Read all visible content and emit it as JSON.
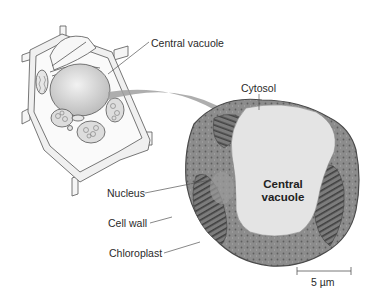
{
  "diagram": {
    "title": "",
    "labels": {
      "central_vacuole_illustration": "Central vacuole",
      "cytosol": "Cytosol",
      "central_vacuole_micrograph_line1": "Central",
      "central_vacuole_micrograph_line2": "vacuole",
      "nucleus": "Nucleus",
      "cell_wall": "Cell wall",
      "chloroplast": "Chloroplast"
    },
    "scale_bar": {
      "label": "5 µm"
    },
    "panels": [
      {
        "name": "plant-cell-illustration",
        "description": "3D cutaway drawing of a plant cell"
      },
      {
        "name": "plant-cell-micrograph",
        "description": "Electron micrograph of a plant cell showing central vacuole"
      }
    ],
    "arrow": {
      "from": "plant-cell-illustration",
      "to": "plant-cell-micrograph"
    },
    "colors": {
      "background": "#ffffff",
      "vacuole": "#e2e2e2",
      "cytoplasm": "#8a8a8a",
      "arrow": "#9a9a9a",
      "line": "#555555"
    }
  }
}
